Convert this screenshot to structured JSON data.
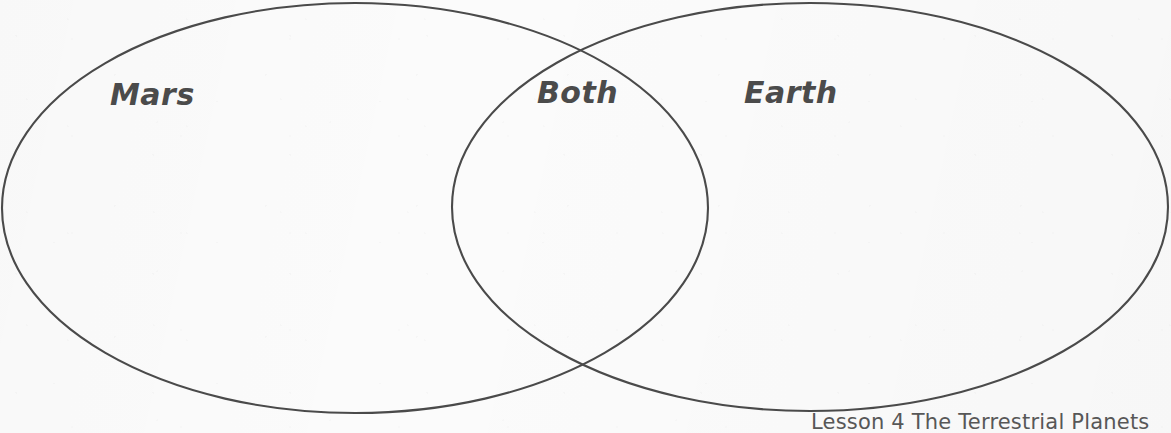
{
  "page": {
    "background_color": "#fbfbfb",
    "ink_color": "#4b4b4b",
    "width": 1171,
    "height": 433
  },
  "diagram": {
    "type": "venn",
    "sets": [
      {
        "id": "left",
        "label": "Mars",
        "cx": 355,
        "cy": 208,
        "rx": 353,
        "ry": 205
      },
      {
        "id": "right",
        "label": "Earth",
        "cx": 810,
        "cy": 207,
        "rx": 358,
        "ry": 204
      }
    ],
    "intersection": {
      "label": "Both"
    },
    "stroke_color": "#4a4a4a",
    "stroke_width": 2
  },
  "labels": {
    "left_label": "Mars",
    "intersection_label": "Both",
    "right_label": "Earth"
  },
  "footer": {
    "caption": "Lesson 4 The Terrestrial Planets"
  }
}
